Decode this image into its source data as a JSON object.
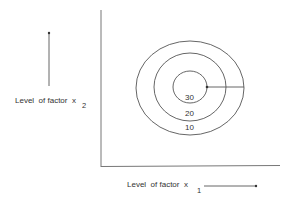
{
  "diagram": {
    "title": "",
    "x_axis": {
      "label": "Level  of factor  x",
      "subscript": "1"
    },
    "y_axis": {
      "label": "Level  of factor  x",
      "subscript": "2"
    },
    "contours": [
      {
        "level": "10",
        "position": "outer"
      },
      {
        "level": "20",
        "position": "middle"
      },
      {
        "level": "30",
        "position": "inner"
      }
    ],
    "colors": {
      "line": "#555555",
      "text": "#333333",
      "background": "#ffffff"
    }
  }
}
